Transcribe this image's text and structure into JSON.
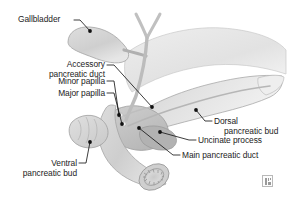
{
  "figure": {
    "domain_subject": "pancreatic and biliary anatomy illustration",
    "background_color": "#ffffff",
    "label_text_color": "#232323",
    "leader_line_color": "#1a1a1a",
    "anchor_dot_color": "#111111",
    "organ_fill_light": "#e8e8e8",
    "organ_fill_mid": "#d6d6d6",
    "organ_fill_dark": "#bdbdbd",
    "organ_outline": "#9e9e9e"
  },
  "labels": {
    "gallbladder": {
      "text": "Gallbladder",
      "align": "left"
    },
    "accessory_pancreatic_duct": {
      "line1": "Accessory",
      "line2": "pancreatic duct",
      "align": "right"
    },
    "minor_papilla": {
      "text": "Minor papilla",
      "align": "right"
    },
    "major_papilla": {
      "text": "Major papilla",
      "align": "right"
    },
    "ventral_pancreatic_bud": {
      "line1": "Ventral",
      "line2": "pancreatic bud",
      "align": "right"
    },
    "dorsal_pancreatic_bud": {
      "line1": "Dorsal",
      "line2": "pancreatic bud",
      "align": "left"
    },
    "uncinate_process": {
      "text": "Uncinate process",
      "align": "left"
    },
    "main_pancreatic_duct": {
      "text": "Main pancreatic duct",
      "align": "left"
    }
  },
  "attribution": {
    "name": "image-placeholder-mark"
  }
}
